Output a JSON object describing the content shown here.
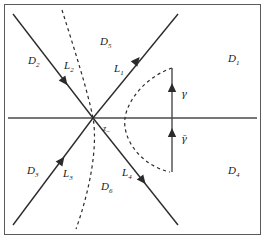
{
  "figure": {
    "colors": {
      "stroke": "#2b2b2b",
      "axis": "#4a4a4a",
      "dashed": "#2b2b2b",
      "frame": "#555555",
      "background": "#ffffff"
    },
    "frame": {
      "visible": true
    }
  },
  "axis": {
    "name": "real-axis",
    "y": 118,
    "x_start": 8,
    "x_end": 257
  },
  "origin": {
    "x": 93,
    "y": 118,
    "label": "z",
    "subscript": "−"
  },
  "rays": [
    {
      "id": "L1",
      "label": "L",
      "subscript": "1",
      "direction": "upper-right",
      "arrow": "outward",
      "label_x": 114,
      "label_y": 72,
      "x1": 93,
      "y1": 118,
      "x2": 178,
      "y2": 14
    },
    {
      "id": "L2",
      "label": "L",
      "subscript": "2",
      "direction": "upper-left",
      "arrow": "inward",
      "label_x": 64,
      "label_y": 69,
      "x1": 93,
      "y1": 118,
      "x2": 13,
      "y2": 14
    },
    {
      "id": "L3",
      "label": "L",
      "subscript": "3",
      "direction": "lower-left",
      "arrow": "inward",
      "label_x": 63,
      "label_y": 177,
      "x1": 93,
      "y1": 118,
      "x2": 13,
      "y2": 225
    },
    {
      "id": "L4",
      "label": "L",
      "subscript": "4",
      "direction": "lower-right",
      "arrow": "outward",
      "label_x": 122,
      "label_y": 176,
      "x1": 93,
      "y1": 118,
      "x2": 178,
      "y2": 225
    }
  ],
  "regions": [
    {
      "id": "D1",
      "label": "D",
      "subscript": "1",
      "x": 228,
      "y": 62
    },
    {
      "id": "D2",
      "label": "D",
      "subscript": "2",
      "x": 28,
      "y": 64
    },
    {
      "id": "D3",
      "label": "D",
      "subscript": "3",
      "x": 27,
      "y": 174
    },
    {
      "id": "D4",
      "label": "D",
      "subscript": "4",
      "x": 228,
      "y": 174
    },
    {
      "id": "D5",
      "label": "D",
      "subscript": "5",
      "x": 100,
      "y": 45
    },
    {
      "id": "D6",
      "label": "D",
      "subscript": "6",
      "x": 101,
      "y": 190
    }
  ],
  "contours": [
    {
      "id": "gamma",
      "label": "γ",
      "style": "solid-vertical-arrow",
      "label_x": 181,
      "label_y": 97,
      "arrow_x": 172,
      "arrow_y": 95,
      "x": 172,
      "y_top": 68,
      "y_bottom": 118
    },
    {
      "id": "gamma-bar",
      "label": "γ̄",
      "style": "solid-vertical-arrow",
      "label_x": 181,
      "label_y": 142,
      "arrow_x": 172,
      "arrow_y": 139,
      "x": 172,
      "y_top": 118,
      "y_bottom": 170
    }
  ],
  "dashed_curves": [
    {
      "id": "steep-dashed-curve",
      "description": "near-vertical dashed curve through origin"
    },
    {
      "id": "right-dashed-parabola",
      "description": "dashed parabola opening to the right, vertex left of gamma"
    }
  ]
}
